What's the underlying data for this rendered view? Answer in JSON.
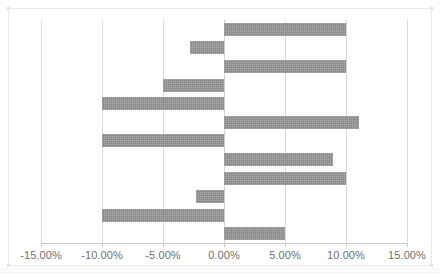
{
  "chart_data": {
    "type": "bar",
    "orientation": "horizontal",
    "title": "",
    "subtitle": "",
    "xlabel": "",
    "ylabel": "",
    "xlim": [
      -15,
      15
    ],
    "ylim": null,
    "grid": true,
    "grid_axis": "x",
    "legend": false,
    "legend_position": "none",
    "bar_color": "#969696",
    "plot_background": "#ffffff",
    "gridline_color": "#d9d9d9",
    "axis_label_color": "#6f6f6f",
    "value_format": "percent_2dp",
    "x_ticks": [
      -15,
      -10,
      -5,
      0,
      5,
      10,
      15
    ],
    "x_tick_labels": [
      "-15.00%",
      "-10.00%",
      "-5.00%",
      "0.00%",
      "5.00%",
      "10.00%",
      "15.00%"
    ],
    "categories": [
      "1",
      "2",
      "3",
      "4",
      "5",
      "6",
      "7",
      "8",
      "9",
      "10",
      "11",
      "12"
    ],
    "category_labels_visible": false,
    "values": [
      10.0,
      -2.8,
      10.0,
      -5.0,
      -10.0,
      11.1,
      -10.0,
      8.9,
      10.0,
      -2.3,
      -10.0,
      5.0
    ],
    "value_labels": [
      "10.00%",
      "-2.80%",
      "10.00%",
      "-5.00%",
      "-10.00%",
      "11.10%",
      "-10.00%",
      "8.90%",
      "10.00%",
      "-2.30%",
      "-10.00%",
      "5.00%"
    ],
    "data_labels_visible": false,
    "annotations": []
  },
  "chart": {
    "tick_labels": [
      "-15.00%",
      "-10.00%",
      "-5.00%",
      "0.00%",
      "5.00%",
      "10.00%",
      "15.00%"
    ]
  }
}
